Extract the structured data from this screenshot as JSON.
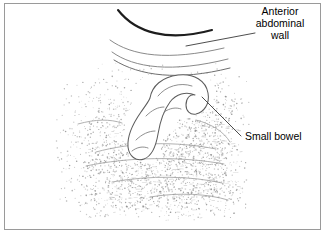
{
  "figure": {
    "type": "medical-line-illustration",
    "background_color": "#ffffff",
    "border_color": "#9a9a9a",
    "width": 325,
    "height": 233
  },
  "labels": [
    {
      "id": "anterior-abdominal-wall",
      "lines": [
        "Anterior",
        "abdominal",
        "wall"
      ],
      "color": "#000000",
      "align": "center",
      "anchor_x": 280,
      "line_y": [
        15,
        27,
        39
      ]
    },
    {
      "id": "small-bowel",
      "lines": [
        "Small bowel"
      ],
      "color": "#000000",
      "align": "start",
      "anchor_x": 245,
      "line_y": [
        140
      ]
    }
  ],
  "leader_lines": [
    {
      "id": "anterior-abdominal-wall-leader",
      "from_x": 255,
      "from_y": 33,
      "to_x": 186,
      "to_y": 46,
      "color": "#3a3a3a"
    },
    {
      "id": "small-bowel-leader",
      "from_x": 241,
      "from_y": 136,
      "to_x": 202,
      "to_y": 97,
      "color": "#3a3a3a"
    }
  ],
  "anatomy": {
    "anterior_wall_arcs": [
      {
        "id": "skin-arc",
        "weight": "thick",
        "color": "#1d1d1d"
      },
      {
        "id": "fat-arc",
        "weight": "thin",
        "color": "#8a8a8a"
      },
      {
        "id": "muscle-arc",
        "weight": "thin",
        "color": "#8a8a8a"
      }
    ],
    "bowel_loop": {
      "id": "small-bowel-loop",
      "shape": "hooked J-shaped loop",
      "fill": "#ffffff",
      "stroke": "#5d5d5d"
    },
    "tissue_texture": {
      "id": "stipple-texture",
      "description": "speckled acoustic shadow stipple",
      "dot_color": "#8e8e8e",
      "dot_count": 1750
    }
  }
}
